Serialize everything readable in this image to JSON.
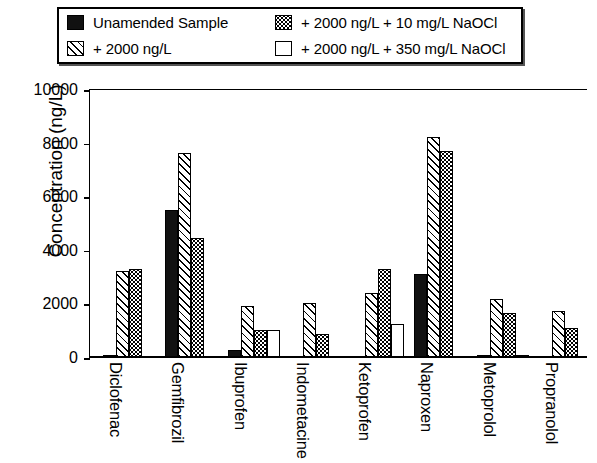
{
  "legend": {
    "rows": [
      [
        {
          "swatch": "solid-black-swatch",
          "fill": "solid",
          "label": "Unamended Sample"
        },
        {
          "swatch": "dotted-swatch",
          "fill": "dots",
          "label": "+ 2000 ng/L + 10 mg/L NaOCl"
        }
      ],
      [
        {
          "swatch": "hatched-swatch",
          "fill": "hatch",
          "label": "+ 2000 ng/L"
        },
        {
          "swatch": "white-swatch",
          "fill": "empty",
          "label": "+ 2000 ng/L + 350 mg/L NaOCl"
        }
      ]
    ]
  },
  "chart_data": {
    "type": "bar",
    "title": "",
    "xlabel": "",
    "ylabel": "Concentration (ng/L)",
    "ylim": [
      0,
      10000
    ],
    "yticks": [
      0,
      2000,
      4000,
      6000,
      8000,
      10000
    ],
    "ytick_labels": [
      "0",
      "2000",
      "4000",
      "6000",
      "8000",
      "10000"
    ],
    "grid": false,
    "legend_position": "top",
    "categories": [
      "Diclofenac",
      "Gemfibrozil",
      "Ibuprofen",
      "Indometacine",
      "Ketoprofen",
      "Naproxen",
      "Metoprolol",
      "Propranolol"
    ],
    "series": [
      {
        "name": "Unamended Sample",
        "fill": "solid",
        "values": [
          60,
          5500,
          250,
          0,
          0,
          3100,
          90,
          0
        ]
      },
      {
        "name": "+ 2000 ng/L",
        "fill": "hatch",
        "values": [
          3200,
          7600,
          1900,
          2000,
          2400,
          8200,
          2150,
          1700
        ]
      },
      {
        "name": "+ 2000 ng/L + 10 mg/L NaOCl",
        "fill": "dots",
        "values": [
          3300,
          4450,
          1000,
          850,
          3300,
          7700,
          1650,
          1100
        ]
      },
      {
        "name": "+ 2000 ng/L + 350 mg/L NaOCl",
        "fill": "empty",
        "values": [
          0,
          0,
          1000,
          0,
          1250,
          0,
          70,
          0
        ]
      }
    ]
  }
}
